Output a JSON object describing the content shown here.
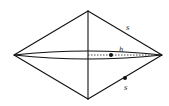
{
  "diagram": {
    "labels": {
      "slant_upper": "s",
      "height": "h",
      "slant_lower": "s"
    },
    "points": {
      "height_marker": "dot on dotted height segment",
      "slant_marker": "dot on lower-right slant edge"
    }
  }
}
